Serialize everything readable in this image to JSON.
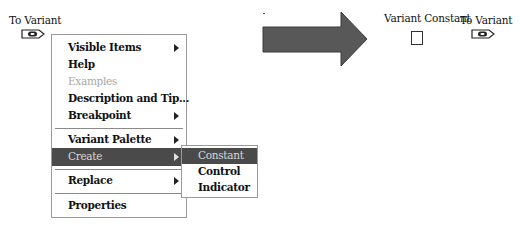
{
  "left_node": {
    "label": "To Variant",
    "icon": "to-variant-icon"
  },
  "context_menu": {
    "items": [
      {
        "label": "Visible Items",
        "submenu": true,
        "state": "normal"
      },
      {
        "label": "Help",
        "submenu": false,
        "state": "normal"
      },
      {
        "label": "Examples",
        "submenu": false,
        "state": "disabled"
      },
      {
        "label": "Description and Tip...",
        "submenu": false,
        "state": "normal"
      },
      {
        "label": "Breakpoint",
        "submenu": true,
        "state": "normal"
      },
      {
        "label": "Variant Palette",
        "submenu": true,
        "state": "normal"
      },
      {
        "label": "Create",
        "submenu": true,
        "state": "highlighted"
      },
      {
        "label": "Replace",
        "submenu": true,
        "state": "normal"
      },
      {
        "label": "Properties",
        "submenu": false,
        "state": "normal"
      }
    ]
  },
  "create_submenu": {
    "items": [
      {
        "label": "Constant",
        "state": "highlighted"
      },
      {
        "label": "Control",
        "state": "normal"
      },
      {
        "label": "Indicator",
        "state": "normal"
      }
    ]
  },
  "arrow": {
    "icon": "right-arrow-icon",
    "color": "#585858"
  },
  "result": {
    "constant_label": "Variant Constant",
    "node_label": "To Variant"
  },
  "colors": {
    "highlight_bg": "#4a4a4a",
    "border": "#9a9a9a",
    "disabled_text": "#a8a8a8"
  }
}
